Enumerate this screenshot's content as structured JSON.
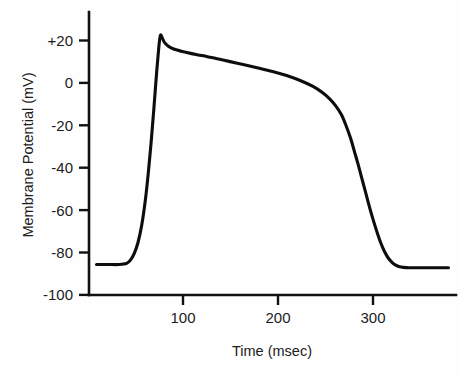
{
  "chart_data": {
    "type": "line",
    "title": "",
    "subtitle": "",
    "xlabel": "Time (msec)",
    "ylabel": "Membrane Potential (mV)",
    "xlim": [
      0,
      390
    ],
    "ylim": [
      -100,
      30
    ],
    "grid": false,
    "legend": null,
    "xticks": [
      100,
      200,
      300
    ],
    "xtick_labels": [
      "100",
      "200",
      "300"
    ],
    "yticks": [
      20,
      0,
      -20,
      -40,
      -60,
      -80,
      -100
    ],
    "ytick_labels": [
      "+20",
      "0",
      "-20",
      "-40",
      "-60",
      "-80",
      "-100"
    ],
    "line_color": "#0d0d0d",
    "background_color": "#ffffff",
    "series": [
      {
        "name": "Ventricular action potential",
        "x": [
          8,
          20,
          32,
          40,
          44,
          48,
          52,
          56,
          60,
          63,
          66,
          69,
          72,
          74,
          75,
          76,
          78,
          80,
          84,
          90,
          98,
          108,
          120,
          135,
          150,
          165,
          180,
          195,
          210,
          225,
          238,
          248,
          256,
          262,
          268,
          273,
          278,
          282,
          286,
          290,
          294,
          298,
          302,
          306,
          310,
          314,
          318,
          322,
          326,
          330,
          334,
          340,
          348,
          358,
          370,
          382
        ],
        "y": [
          -86,
          -86,
          -86,
          -85.5,
          -84,
          -81,
          -76,
          -68,
          -56,
          -44,
          -30,
          -14,
          3,
          13,
          17,
          19.5,
          18,
          16.2,
          14.4,
          13.0,
          12.0,
          11.0,
          10.0,
          8.6,
          7.2,
          5.8,
          4.3,
          2.7,
          0.8,
          -1.6,
          -4.2,
          -7.0,
          -10.0,
          -13.0,
          -17.0,
          -22.0,
          -28.0,
          -34.0,
          -40.0,
          -46.5,
          -53.0,
          -59.5,
          -65.5,
          -71.0,
          -76.0,
          -80.0,
          -83.0,
          -85.0,
          -86.3,
          -87.0,
          -87.3,
          -87.5,
          -87.5,
          -87.5,
          -87.5,
          -87.5
        ]
      }
    ],
    "annotations": []
  },
  "axes": {
    "y_axis_title": "Membrane Potential (mV)",
    "x_axis_title": "Time (msec)",
    "y_tick_texts": [
      "+20",
      "0",
      "-20",
      "-40",
      "-60",
      "-80",
      "-100"
    ],
    "x_tick_texts": [
      "100",
      "200",
      "300"
    ]
  }
}
